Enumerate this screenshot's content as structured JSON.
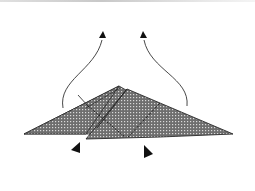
{
  "diagram": {
    "type": "origami-fold-step",
    "colors": {
      "paper_fill": "#7a7a7a",
      "pattern_dot": "#d8d8d8",
      "outline": "#2a2a2a",
      "arrow": "#333333",
      "background": "#ffffff"
    },
    "arrows": [
      {
        "name": "left-fold-up-arrow",
        "direction": "up"
      },
      {
        "name": "right-fold-up-arrow",
        "direction": "up"
      }
    ],
    "markers": [
      {
        "name": "left-pivot-marker"
      },
      {
        "name": "right-pivot-marker"
      }
    ]
  }
}
